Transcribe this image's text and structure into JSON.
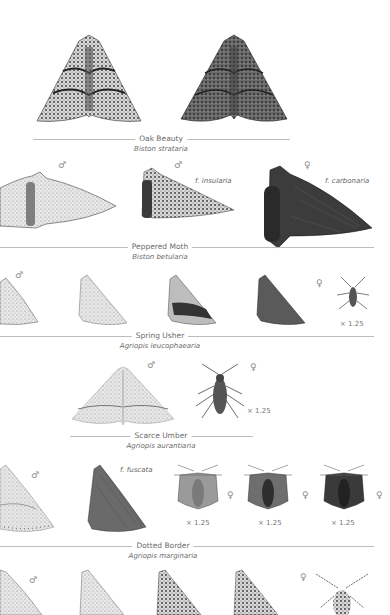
{
  "species": [
    {
      "common_name": "Oak Beauty",
      "latin_name": "Biston strataria",
      "figures": [
        "spread-pale",
        "spread-dark"
      ]
    },
    {
      "common_name": "Peppered Moth",
      "latin_name": "Biston betularia",
      "figures": [
        {
          "sex": "♂",
          "form": ""
        },
        {
          "sex": "♂",
          "form": "f. insularia"
        },
        {
          "sex": "♀",
          "form": "f. carbonaria"
        }
      ]
    },
    {
      "common_name": "Spring Usher",
      "latin_name": "Agriopis leucophaearia",
      "figures": [
        {
          "sex": "♂"
        },
        {
          "sex": ""
        },
        {
          "sex": ""
        },
        {
          "sex": ""
        },
        {
          "sex": "♀",
          "scale": "× 1.25"
        }
      ]
    },
    {
      "common_name": "Scarce Umber",
      "latin_name": "Agriopis aurantiaria",
      "figures": [
        {
          "sex": "♂"
        },
        {
          "sex": "♀",
          "scale": "× 1.25"
        }
      ]
    },
    {
      "common_name": "Dotted Border",
      "latin_name": "Agriopis marginaria",
      "figures": [
        {
          "sex": "♂"
        },
        {
          "sex": "",
          "form": "f. fuscata"
        },
        {
          "sex": "♀",
          "scale": "× 1.25"
        },
        {
          "sex": "♀",
          "scale": "× 1.25"
        },
        {
          "sex": "♀",
          "scale": "× 1.25"
        }
      ]
    },
    {
      "common_name": "",
      "latin_name": "",
      "figures": [
        {
          "sex": "♂"
        },
        {
          "sex": ""
        },
        {
          "sex": ""
        },
        {
          "sex": ""
        },
        {
          "sex": "♀"
        }
      ]
    }
  ],
  "colors": {
    "rule": "#bdbdbd",
    "text": "#6a6a6a",
    "moth_dark": "#3a3a3a",
    "moth_mid": "#7a7a7a",
    "moth_light": "#cfcfcf"
  }
}
